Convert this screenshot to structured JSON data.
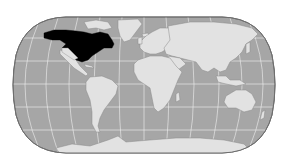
{
  "map": {
    "title": "World map highlighting North America (Canada and United States)",
    "projection": "pseudo-cylindrical (Robinson-like)",
    "colors": {
      "background": "#ffffff",
      "ocean": "#a6a6a6",
      "ocean_outline": "#6e6e6e",
      "land": "#e2e2e2",
      "land_outline": "#8a8a8a",
      "highlight": "#000000",
      "graticule": "#f2f2f2"
    },
    "highlighted_regions": [
      {
        "name": "Canada",
        "color": "#000000"
      },
      {
        "name": "United States",
        "color": "#000000"
      }
    ],
    "regions": [
      {
        "name": "Mexico & Central America"
      },
      {
        "name": "South America"
      },
      {
        "name": "Greenland"
      },
      {
        "name": "Europe"
      },
      {
        "name": "Africa"
      },
      {
        "name": "Asia"
      },
      {
        "name": "Australia"
      },
      {
        "name": "Antarctica"
      }
    ]
  }
}
